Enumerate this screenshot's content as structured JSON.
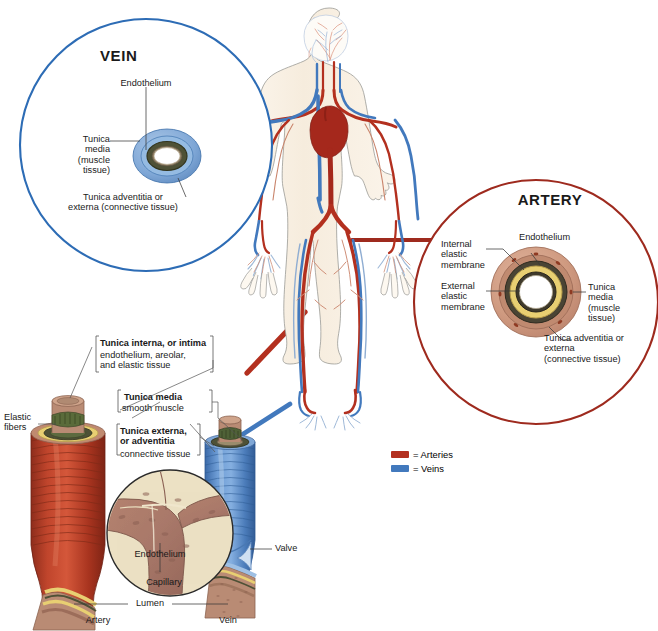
{
  "figure": {
    "kind": "anatomy-illustration"
  },
  "vein_inset": {
    "title": "VEIN",
    "labels": {
      "endothelium": "Endothelium",
      "tunica_media": "Tunica\nmedia\n(muscle\ntissue)",
      "tunica_adventitia": "Tunica adventitia or\nexterna (connective tissue)"
    },
    "circle_color": "#2d6cb5"
  },
  "artery_inset": {
    "title": "ARTERY",
    "labels": {
      "endothelium": "Endothelium",
      "internal_elastic": "Internal\nelastic\nmembrane",
      "external_elastic": "External\nelastic\nmembrane",
      "tunica_media": "Tunica\nmedia\n(muscle\ntissue)",
      "tunica_adventitia": "Tunica adventitia or\nexterna\n(connective tissue)"
    },
    "circle_color": "#9e2a1e"
  },
  "vessel_detail": {
    "elastic_fibers": "Elastic\nfibers",
    "tunica_interna_bold": "Tunica interna, or intima",
    "tunica_interna_desc": "endothelium, areolar,\nand elastic tissue",
    "tunica_media_bold": "Tunica media",
    "tunica_media_desc": "smooth muscle",
    "tunica_externa_bold": "Tunica externa,\nor adventitia",
    "tunica_externa_desc": "connective tissue",
    "endothelium": "Endothelium",
    "capillary": "Capillary",
    "lumen": "Lumen",
    "valve": "Valve",
    "artery": "Artery",
    "vein": "Vein"
  },
  "legend": {
    "items": [
      {
        "label": "= Arteries",
        "color": "#b3301f"
      },
      {
        "label": "= Veins",
        "color": "#4279bd"
      }
    ]
  },
  "palette": {
    "artery_red": "#b3301f",
    "vein_blue": "#4279bd",
    "skin": "#f7efe2",
    "heart_red": "#a5281c",
    "vessel_tan": "#c79a80",
    "elastic_yellow": "#e8cf72",
    "media_dark": "#3b3b30",
    "capillary_bg": "#ece1c4",
    "capillary_brown": "#a9796a"
  }
}
